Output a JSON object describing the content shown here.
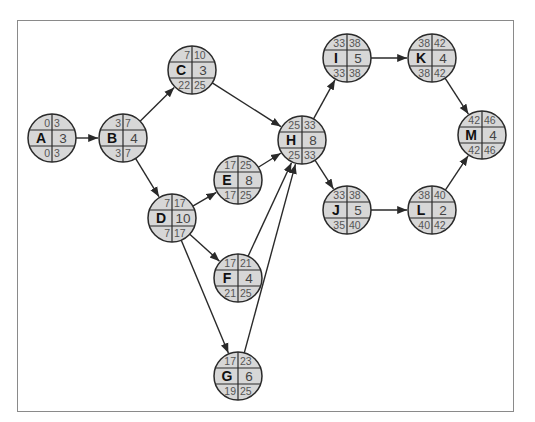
{
  "colors": {
    "node_fill": "#d7d7d7",
    "stroke": "#2a2a2a",
    "frame": "#8a8a8a",
    "text_small": "#555555"
  },
  "legend_layout": "top: ES | EF ; middle: Activity | Duration ; bottom: LS | LF",
  "nodes": [
    {
      "id": "A",
      "x": 52,
      "y": 138,
      "es": "0",
      "ef": "3",
      "dur": "3",
      "ls": "0",
      "lf": "3"
    },
    {
      "id": "B",
      "x": 123,
      "y": 138,
      "es": "3",
      "ef": "7",
      "dur": "4",
      "ls": "3",
      "lf": "7"
    },
    {
      "id": "C",
      "x": 192,
      "y": 70,
      "es": "7",
      "ef": "10",
      "dur": "3",
      "ls": "22",
      "lf": "25"
    },
    {
      "id": "D",
      "x": 172,
      "y": 218,
      "es": "7",
      "ef": "17",
      "dur": "10",
      "ls": "7",
      "lf": "17"
    },
    {
      "id": "E",
      "x": 238,
      "y": 180,
      "es": "17",
      "ef": "25",
      "dur": "8",
      "ls": "17",
      "lf": "25"
    },
    {
      "id": "F",
      "x": 238,
      "y": 278,
      "es": "17",
      "ef": "21",
      "dur": "4",
      "ls": "21",
      "lf": "25"
    },
    {
      "id": "G",
      "x": 238,
      "y": 376,
      "es": "17",
      "ef": "23",
      "dur": "6",
      "ls": "19",
      "lf": "25"
    },
    {
      "id": "H",
      "x": 302,
      "y": 140,
      "es": "25",
      "ef": "33",
      "dur": "8",
      "ls": "25",
      "lf": "33"
    },
    {
      "id": "I",
      "x": 347,
      "y": 58,
      "es": "33",
      "ef": "38",
      "dur": "5",
      "ls": "33",
      "lf": "38"
    },
    {
      "id": "J",
      "x": 347,
      "y": 210,
      "es": "33",
      "ef": "38",
      "dur": "5",
      "ls": "35",
      "lf": "40"
    },
    {
      "id": "K",
      "x": 432,
      "y": 58,
      "es": "38",
      "ef": "42",
      "dur": "4",
      "ls": "38",
      "lf": "42"
    },
    {
      "id": "L",
      "x": 432,
      "y": 210,
      "es": "38",
      "ef": "40",
      "dur": "2",
      "ls": "40",
      "lf": "42"
    },
    {
      "id": "M",
      "x": 482,
      "y": 135,
      "es": "42",
      "ef": "46",
      "dur": "4",
      "ls": "42",
      "lf": "46"
    }
  ],
  "edges": [
    [
      "A",
      "B"
    ],
    [
      "B",
      "C"
    ],
    [
      "B",
      "D"
    ],
    [
      "C",
      "H"
    ],
    [
      "D",
      "E"
    ],
    [
      "D",
      "F"
    ],
    [
      "D",
      "G"
    ],
    [
      "E",
      "H"
    ],
    [
      "F",
      "H"
    ],
    [
      "G",
      "H"
    ],
    [
      "H",
      "I"
    ],
    [
      "H",
      "J"
    ],
    [
      "I",
      "K"
    ],
    [
      "J",
      "L"
    ],
    [
      "K",
      "M"
    ],
    [
      "L",
      "M"
    ]
  ],
  "node_radius": 24
}
